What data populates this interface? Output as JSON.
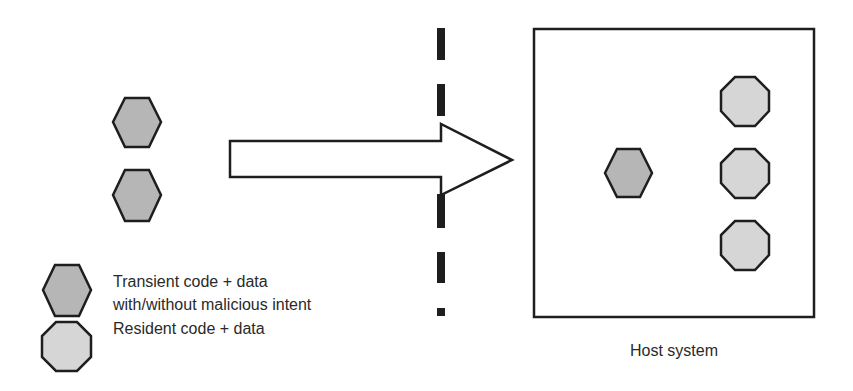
{
  "diagram": {
    "colors": {
      "transient_fill": "#b6b6b6",
      "resident_fill": "#d6d6d6",
      "stroke": "#1e1e1e",
      "background": "#ffffff"
    },
    "outside": {
      "transient_items": [
        {
          "shape": "hexagon",
          "kind": "transient"
        },
        {
          "shape": "hexagon",
          "kind": "transient"
        }
      ]
    },
    "arrow": {
      "direction": "right",
      "meaning": "transfer into host"
    },
    "boundary": {
      "style": "dashed-vertical-line"
    },
    "host": {
      "label": "Host system",
      "items": [
        {
          "shape": "hexagon",
          "kind": "transient"
        },
        {
          "shape": "octagon",
          "kind": "resident"
        },
        {
          "shape": "octagon",
          "kind": "resident"
        },
        {
          "shape": "octagon",
          "kind": "resident"
        }
      ]
    },
    "legend": {
      "transient_line1": "Transient code + data",
      "transient_line2": "with/without malicious intent",
      "resident": "Resident code + data"
    }
  }
}
